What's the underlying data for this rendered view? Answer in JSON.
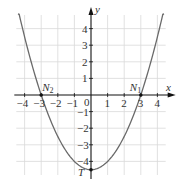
{
  "chart_data": {
    "type": "line",
    "title": "",
    "function": "y = 0.5x^2 - 4.5",
    "xlabel": "x",
    "ylabel": "y",
    "xlim": [
      -4.5,
      4.5
    ],
    "ylim": [
      -5,
      5
    ],
    "grid": true,
    "x_ticks": [
      "-4",
      "-3",
      "-2",
      "-1",
      "0",
      "1",
      "2",
      "3",
      "4"
    ],
    "y_ticks": [
      "4",
      "3",
      "2",
      "1",
      "-1",
      "-2",
      "-3",
      "-4"
    ],
    "series": [
      {
        "name": "parabola",
        "x": [
          -4.4,
          -4,
          -3,
          -2,
          -1,
          0,
          1,
          2,
          3,
          4,
          4.4
        ],
        "y": [
          5.18,
          3.5,
          0,
          -2.5,
          -4,
          -4.5,
          -4,
          -2.5,
          0,
          3.5,
          5.18
        ]
      }
    ],
    "annotations": [
      {
        "label": "N",
        "sub": "2",
        "x": -3,
        "y": 0
      },
      {
        "label": "N",
        "sub": "1",
        "x": 3,
        "y": 0
      },
      {
        "label": "T",
        "sub": "",
        "x": 0,
        "y": -4.5
      }
    ],
    "colors": {
      "curve": "#6a6a6a",
      "axis": "#111111",
      "grid": "#d9d9d9"
    }
  }
}
